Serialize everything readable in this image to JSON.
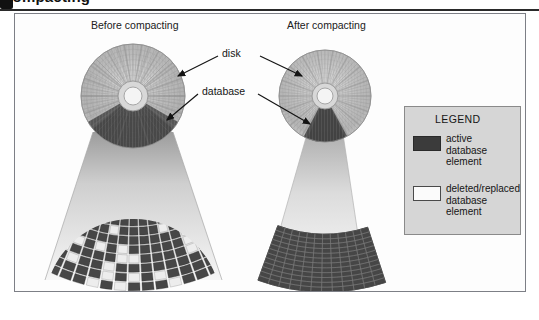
{
  "page_header": {
    "text": "compacting",
    "bullet_icon": "square-bullet-icon"
  },
  "figure": {
    "panels": [
      {
        "id": "before",
        "caption": "Before compacting"
      },
      {
        "id": "after",
        "caption": "After compacting"
      }
    ],
    "callouts": [
      {
        "id": "disk",
        "label": "disk"
      },
      {
        "id": "database",
        "label": "database"
      }
    ]
  },
  "legend": {
    "title": "LEGEND",
    "entries": [
      {
        "id": "active",
        "label": "active\ndatabase\nelement",
        "swatch_color": "#3b3b3b",
        "swatch_border": "#2a2a2a"
      },
      {
        "id": "deleted",
        "label": "deleted/replaced\ndatabase\nelement",
        "swatch_color": "#fbfbfb",
        "swatch_border": "#4a4a4a"
      }
    ],
    "background": "#d6d6d6"
  },
  "colors": {
    "disk_surface": "#b9b9b9",
    "disk_surface_light": "#e2e2e2",
    "wedge_dark": "#4a4a4a",
    "cone_light": "#efefef",
    "cone_mid": "#c3c3c3",
    "fan_cell_active": "#464646",
    "fan_cell_deleted": "#ededed",
    "frame_border": "#7d7f86",
    "figure_background": "#fdfdfd",
    "arrow": "#141414"
  },
  "diagram_data": {
    "type": "diagram",
    "description": "Disk compaction illustration: before and after compacting a database stored on a disk.",
    "before": {
      "disk_center": [
        118,
        82
      ],
      "disk_radius": 52,
      "wedge_start_angle_deg": 40,
      "wedge_end_angle_deg": 140,
      "fan_rings": 8,
      "fan_sectors": 25,
      "fan_fill_description": "mixed active (dark) and deleted/replaced (light) cells scattered throughout"
    },
    "after": {
      "disk_center": [
        310,
        82
      ],
      "disk_radius": 46,
      "wedge_start_angle_deg": 70,
      "wedge_end_angle_deg": 110,
      "fan_rings": 12,
      "fan_sectors": 12,
      "fan_fill_description": "all cells active (dark); deleted elements removed and data packed contiguously"
    }
  }
}
